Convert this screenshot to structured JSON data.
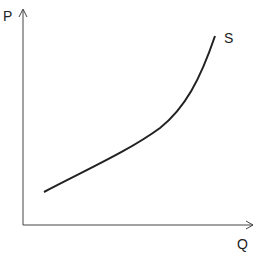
{
  "diagram": {
    "y_axis_label": "P",
    "x_axis_label": "Q",
    "curve_label": "S",
    "colors": {
      "line": "#222222",
      "axis": "#444444",
      "background": "#ffffff"
    }
  }
}
